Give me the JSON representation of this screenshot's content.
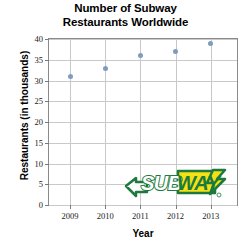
{
  "chart_data": {
    "type": "scatter",
    "title": "Number of Subway Restaurants Worldwide",
    "title_line1": "Number of Subway",
    "title_line2": "Restaurants Worldwide",
    "xlabel": "Year",
    "ylabel": "Restaurants (in thousands)",
    "x": [
      2009,
      2010,
      2011,
      2012,
      2013
    ],
    "categories": [
      "2009",
      "2010",
      "2011",
      "2012",
      "2013"
    ],
    "values": [
      31,
      33,
      36,
      37,
      39
    ],
    "xlim": [
      2008.4,
      2013.75
    ],
    "ylim": [
      0,
      40
    ],
    "xticks": [
      2009,
      2010,
      2011,
      2012,
      2013
    ],
    "xtick_labels": [
      "2009",
      "2010",
      "2011",
      "2012",
      "2013"
    ],
    "yticks": [
      0,
      5,
      10,
      15,
      20,
      25,
      30,
      35,
      40
    ],
    "ytick_labels": [
      "0",
      "5",
      "10",
      "15",
      "20",
      "25",
      "30",
      "35",
      "40"
    ],
    "grid": true,
    "grid_axis": "both",
    "legend": null,
    "marker_color": "#7e9bc0",
    "grid_color": "#c9c9c9",
    "axis_color": "#8a8a8a",
    "series": [
      {
        "name": "Restaurants (in thousands)",
        "points": [
          {
            "x": "2009",
            "y": 31
          },
          {
            "x": "2010",
            "y": 33
          },
          {
            "x": "2011",
            "y": 36
          },
          {
            "x": "2012",
            "y": 37
          },
          {
            "x": "2013",
            "y": 39
          }
        ]
      }
    ]
  },
  "watermark": {
    "name": "subway-logo",
    "text_part1": "SUB",
    "text_part2": "WAY",
    "green": "#1d7a3e",
    "yellow": "#f4e014",
    "white": "#ffffff"
  }
}
